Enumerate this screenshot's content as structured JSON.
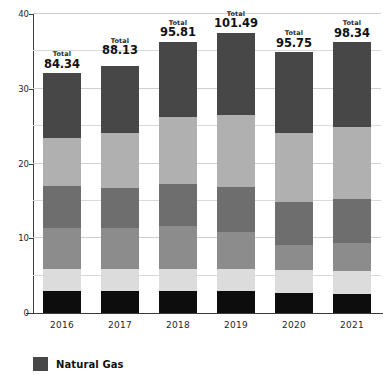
{
  "chart_data": {
    "type": "bar",
    "subtype": "stacked-bar",
    "title": "",
    "xlabel": "",
    "ylabel": "",
    "ylim": [
      0,
      40
    ],
    "yticks": [
      0,
      10,
      20,
      30,
      40
    ],
    "ytick_labels": [
      "0",
      "10",
      "20",
      "30",
      "40"
    ],
    "minor_gridlines": [
      5,
      15,
      25,
      35
    ],
    "grid": true,
    "legend_position": "bottom-left",
    "categories": [
      "2016",
      "2017",
      "2018",
      "2019",
      "2020",
      "2021"
    ],
    "series": [
      {
        "name": "Natural Gas",
        "color": "#474747",
        "order": "top",
        "values": [
          8.7,
          9.0,
          10.1,
          11.0,
          10.8,
          11.3
        ]
      },
      {
        "name": "Segment 4",
        "color": "#b0b0b0",
        "values": [
          6.4,
          7.4,
          8.9,
          9.7,
          9.3,
          9.6
        ]
      },
      {
        "name": "Segment 3",
        "color": "#6e6e6e",
        "values": [
          5.6,
          5.3,
          5.7,
          5.9,
          5.7,
          5.9
        ]
      },
      {
        "name": "Segment 2",
        "color": "#8c8c8c",
        "values": [
          5.5,
          5.5,
          5.7,
          5.0,
          3.4,
          3.8
        ]
      },
      {
        "name": "Segment 1",
        "color": "#dcdcdc",
        "values": [
          3.0,
          3.0,
          3.0,
          3.0,
          3.0,
          3.0
        ]
      },
      {
        "name": "Base",
        "color": "#0d0d0d",
        "order": "bottom",
        "values": [
          2.9,
          2.9,
          2.9,
          2.9,
          2.7,
          2.6
        ]
      }
    ],
    "bar_tops": [
      32.1,
      33.9,
      36.3,
      37.5,
      34.9,
      36.2
    ],
    "annotations": [
      {
        "category": "2016",
        "label": "Total",
        "value": "84.34"
      },
      {
        "category": "2017",
        "label": "Total",
        "value": "88.13"
      },
      {
        "category": "2018",
        "label": "Total",
        "value": "95.81"
      },
      {
        "category": "2019",
        "label": "Total",
        "value": "101.49"
      },
      {
        "category": "2020",
        "label": "Total",
        "value": "95.75"
      },
      {
        "category": "2021",
        "label": "Total",
        "value": "98.34"
      }
    ]
  },
  "axis": {
    "y": {
      "ticks": [
        {
          "label": "40",
          "value": 40
        },
        {
          "label": "30",
          "value": 30
        },
        {
          "label": "20",
          "value": 20
        },
        {
          "label": "10",
          "value": 10
        },
        {
          "label": "0",
          "value": 0
        }
      ]
    },
    "x": {
      "ticks": [
        {
          "label": "2016"
        },
        {
          "label": "2017"
        },
        {
          "label": "2018"
        },
        {
          "label": "2019"
        },
        {
          "label": "2020"
        },
        {
          "label": "2021"
        }
      ]
    }
  },
  "legend": {
    "items": [
      {
        "label": "Natural Gas",
        "color": "#474747"
      }
    ]
  },
  "totals": {
    "word": "Total",
    "items": [
      {
        "value": "84.34"
      },
      {
        "value": "88.13"
      },
      {
        "value": "95.81"
      },
      {
        "value": "101.49"
      },
      {
        "value": "95.75"
      },
      {
        "value": "98.34"
      }
    ]
  }
}
